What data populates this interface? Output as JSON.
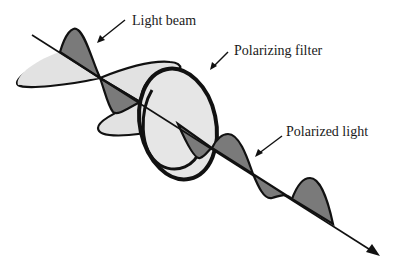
{
  "diagram": {
    "labels": {
      "light_beam": "Light beam",
      "polarizing_filter": "Polarizing filter",
      "polarized_light": "Polarized light"
    },
    "colors": {
      "background": "#ffffff",
      "stroke": "#111111",
      "dark_fill": "#7a7a7a",
      "light_fill": "#e2e2e2",
      "text": "#1a1a1a"
    },
    "elements": [
      {
        "id": "beam-axis",
        "type": "arrow-line",
        "from": [
          32,
          35
        ],
        "to": [
          378,
          255
        ]
      },
      {
        "id": "unpolarized-wave",
        "description": "multiple oscillation planes before filter"
      },
      {
        "id": "polarizing-filter",
        "type": "ring",
        "center": [
          178,
          124
        ],
        "rx": 40,
        "ry": 57
      },
      {
        "id": "polarized-wave",
        "description": "single-plane wave after filter"
      }
    ]
  }
}
